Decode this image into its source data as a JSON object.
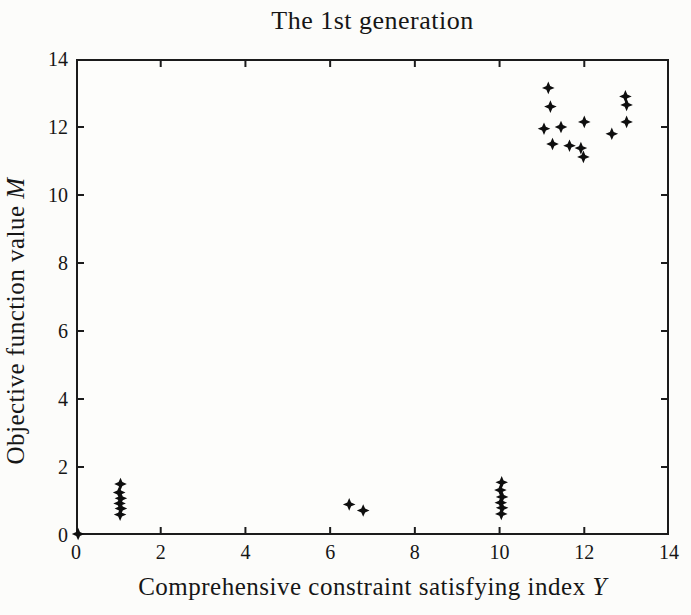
{
  "title": "The 1st generation",
  "axes": {
    "x": {
      "label": "Comprehensive constraint satisfying index",
      "variable": "Y"
    },
    "y": {
      "label": "Objective function value",
      "variable": "M"
    }
  },
  "chart_data": {
    "type": "scatter",
    "title": "The 1st generation",
    "xlabel": "Comprehensive constraint satisfying index Y",
    "ylabel": "Objective function value M",
    "xlim": [
      0,
      14
    ],
    "ylim": [
      0,
      14
    ],
    "x_ticks": [
      0,
      2,
      4,
      6,
      8,
      10,
      12,
      14
    ],
    "y_ticks": [
      0,
      2,
      4,
      6,
      8,
      10,
      12,
      14
    ],
    "grid": false,
    "legend": null,
    "marker": "four-point-star",
    "marker_color": "#0e0e0e",
    "axis_color": "#1b1b1b",
    "points": [
      [
        0.05,
        0.03
      ],
      [
        1.05,
        1.5
      ],
      [
        1.02,
        1.25
      ],
      [
        1.06,
        1.08
      ],
      [
        1.03,
        0.93
      ],
      [
        1.06,
        0.78
      ],
      [
        1.04,
        0.6
      ],
      [
        6.45,
        0.9
      ],
      [
        6.78,
        0.72
      ],
      [
        10.05,
        1.55
      ],
      [
        10.02,
        1.32
      ],
      [
        10.06,
        1.12
      ],
      [
        10.03,
        0.95
      ],
      [
        10.06,
        0.8
      ],
      [
        10.04,
        0.62
      ],
      [
        11.15,
        13.15
      ],
      [
        11.2,
        12.6
      ],
      [
        11.05,
        11.95
      ],
      [
        11.45,
        12.0
      ],
      [
        11.25,
        11.5
      ],
      [
        11.65,
        11.45
      ],
      [
        11.92,
        11.38
      ],
      [
        11.98,
        11.12
      ],
      [
        12.0,
        12.15
      ],
      [
        12.65,
        11.8
      ],
      [
        12.97,
        12.9
      ],
      [
        13.0,
        12.65
      ],
      [
        13.0,
        12.15
      ]
    ]
  }
}
